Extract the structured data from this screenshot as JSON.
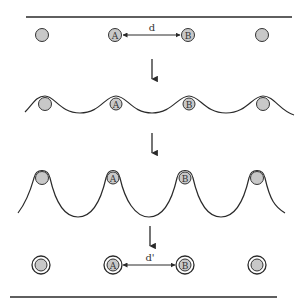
{
  "diagram": {
    "colors": {
      "line": "#2a2a2a",
      "particle_fill": "#c8c8c8",
      "particle_stroke": "#333333",
      "background": "#ffffff"
    },
    "stages": [
      {
        "id": "stage-1-flat-interface",
        "description": "Particles on flat interface",
        "particles": [
          "",
          "A",
          "B",
          ""
        ],
        "distance_label": "d"
      },
      {
        "id": "stage-2-small-deformation",
        "description": "Interface begins to deform around particles",
        "particles": [
          "",
          "A",
          "B",
          ""
        ]
      },
      {
        "id": "stage-3-large-deformation",
        "description": "Interface strongly wraps particles",
        "particles": [
          "",
          "A",
          "B",
          ""
        ]
      },
      {
        "id": "stage-4-encapsulated",
        "description": "Particles coated (double ring)",
        "particles": [
          "",
          "A",
          "B",
          ""
        ],
        "distance_label": "d'"
      }
    ]
  },
  "labels": {
    "particle_a": "A",
    "particle_b": "B",
    "distance_initial": "d",
    "distance_final": "d'"
  }
}
